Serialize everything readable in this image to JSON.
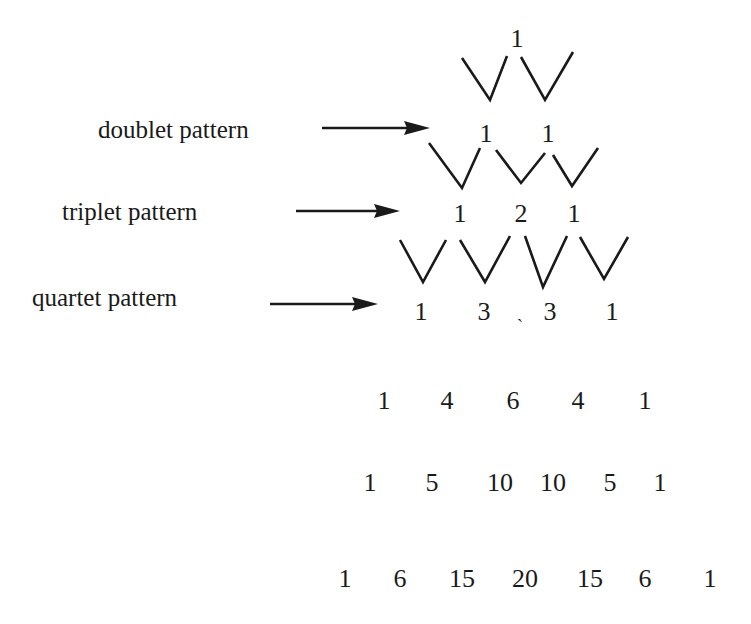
{
  "labels": {
    "doublet": "doublet pattern",
    "triplet": "triplet pattern",
    "quartet": "quartet pattern"
  },
  "rows": [
    [
      "1"
    ],
    [
      "1",
      "1"
    ],
    [
      "1",
      "2",
      "1"
    ],
    [
      "1",
      "3",
      "3",
      "1"
    ],
    [
      "1",
      "4",
      "6",
      "4",
      "1"
    ],
    [
      "1",
      "5",
      "10",
      "10",
      "5",
      "1"
    ],
    [
      "1",
      "6",
      "15",
      "20",
      "15",
      "6",
      "1"
    ]
  ],
  "stray_mark": "ˏ"
}
